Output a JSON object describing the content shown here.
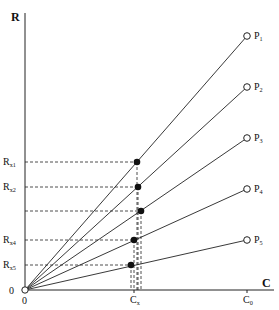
{
  "diagram": {
    "axes": {
      "y_label": "R",
      "x_label": "C",
      "origin_x_label": "0",
      "origin_y_label": "0",
      "x_ticks": [
        {
          "label": "C",
          "sub": "x",
          "x": 134
        },
        {
          "label": "C",
          "sub": "0",
          "x": 247
        }
      ]
    },
    "origin": {
      "x": 25,
      "y": 290
    },
    "lines": [
      {
        "name": "P",
        "sub": "1",
        "end": {
          "x": 247,
          "y": 36
        }
      },
      {
        "name": "P",
        "sub": "2",
        "end": {
          "x": 247,
          "y": 87
        }
      },
      {
        "name": "P",
        "sub": "3",
        "end": {
          "x": 247,
          "y": 138
        }
      },
      {
        "name": "P",
        "sub": "4",
        "end": {
          "x": 247,
          "y": 189
        }
      },
      {
        "name": "P",
        "sub": "5",
        "end": {
          "x": 247,
          "y": 240
        }
      }
    ],
    "intersections": [
      {
        "label": "R",
        "sub": "x1",
        "x": 137,
        "y": 162
      },
      {
        "label": "R",
        "sub": "x2",
        "x": 138,
        "y": 187
      },
      {
        "label": "",
        "sub": "",
        "x": 141,
        "y": 211
      },
      {
        "label": "R",
        "sub": "x4",
        "x": 134,
        "y": 240
      },
      {
        "label": "R",
        "sub": "x5",
        "x": 131,
        "y": 265
      }
    ]
  }
}
